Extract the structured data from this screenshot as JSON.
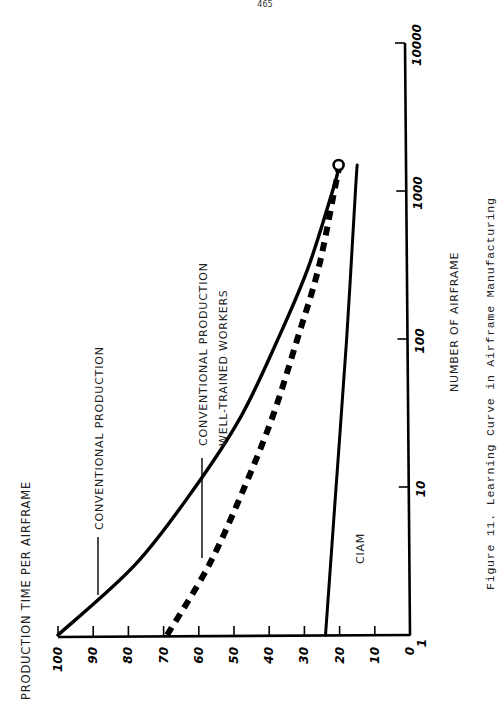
{
  "page": {
    "number": "465"
  },
  "figure": {
    "caption": "Figure 11.  Learning Curve in Airframe Manufacturing"
  },
  "chart_data": {
    "type": "line",
    "title": "Learning Curve in Airframe Manufacturing",
    "orientation": "rotated 90° counter-clockwise on page",
    "xlabel": "NUMBER OF AIRFRAME",
    "ylabel": "PRODUCTION TIME PER AIRFRAME",
    "xscale": "log",
    "xlim": [
      1,
      10000
    ],
    "ylim": [
      0,
      100
    ],
    "x_ticks": [
      1,
      10,
      100,
      1000,
      10000
    ],
    "x_tick_labels": [
      "1",
      "10",
      "100",
      "1000",
      "10000"
    ],
    "y_ticks": [
      0,
      10,
      20,
      30,
      40,
      50,
      60,
      70,
      80,
      90,
      100
    ],
    "y_tick_labels": [
      "0",
      "10",
      "20",
      "30",
      "40",
      "50",
      "60",
      "70",
      "80",
      "90",
      "100"
    ],
    "grid": false,
    "legend": "inline labels with leader lines",
    "series": [
      {
        "name": "CONVENTIONAL PRODUCTION",
        "style": "solid-thick",
        "x": [
          1,
          3,
          10,
          30,
          100,
          300,
          1000,
          1500
        ],
        "y": [
          100,
          78,
          61,
          48,
          37.5,
          29,
          22,
          20
        ]
      },
      {
        "name": "CONVENTIONAL PRODUCTION WELL-TRAINED WORKERS",
        "style": "dashed-thick",
        "x": [
          1,
          3,
          10,
          30,
          100,
          300,
          1000,
          1500
        ],
        "y": [
          69,
          57,
          47,
          39,
          32,
          26,
          21.5,
          20
        ],
        "end_marker": "circle"
      },
      {
        "name": "CIAM",
        "style": "solid",
        "x": [
          1,
          10,
          100,
          1000,
          1500
        ],
        "y": [
          24,
          21,
          18,
          15.5,
          15
        ]
      }
    ]
  },
  "labels": {
    "conventional": "CONVENTIONAL PRODUCTION",
    "well_trained_1": "CONVENTIONAL PRODUCTION",
    "well_trained_2": "WELL-TRAINED WORKERS",
    "ciam": "CIAM",
    "xlabel": "NUMBER OF AIRFRAME",
    "ylabel": "PRODUCTION TIME PER AIRFRAME"
  }
}
